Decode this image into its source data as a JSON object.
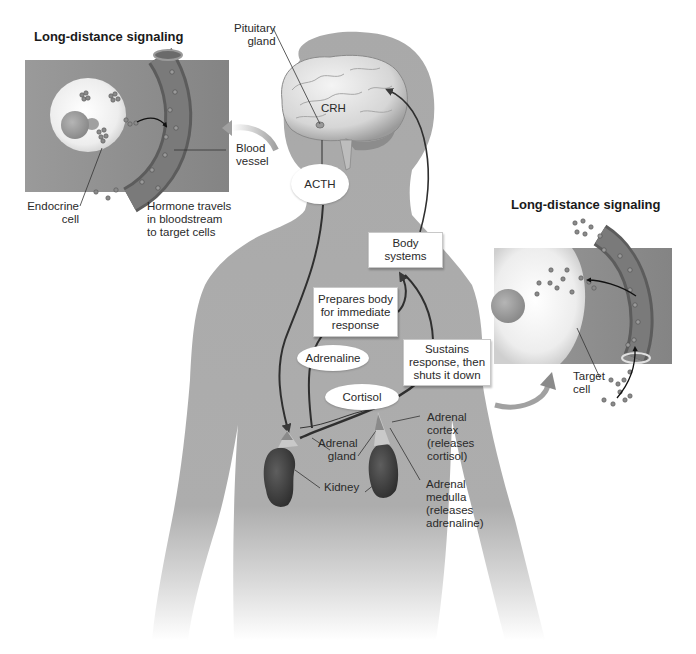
{
  "diagram": {
    "type": "endocrine stress response (HPA axis) illustration",
    "palette": {
      "body": "#a9a9a9",
      "panel_bg": "#8f8f8f",
      "cell": "#f2f2f2",
      "vessel": "#6d6d6d",
      "arrow": "#3a3a3a",
      "box_bg": "#ffffff"
    }
  },
  "panels": {
    "left": {
      "title": "Long-distance signaling",
      "labels": {
        "endocrine_cell": [
          "Endocrine",
          "cell"
        ],
        "hormone_travels": [
          "Hormone travels",
          "in bloodstream",
          "to target cells"
        ],
        "blood_vessel": [
          "Blood",
          "vessel"
        ]
      }
    },
    "right": {
      "title": "Long-distance signaling",
      "labels": {
        "target_cell": [
          "Target",
          "cell"
        ]
      }
    }
  },
  "brain": {
    "pituitary_label": [
      "Pituitary",
      "gland"
    ],
    "crh_label": "CRH"
  },
  "hormones": {
    "acth": "ACTH",
    "adrenaline": "Adrenaline",
    "cortisol": "Cortisol"
  },
  "boxes": {
    "body_systems": [
      "Body",
      "systems"
    ],
    "prepares": [
      "Prepares body",
      "for immediate",
      "response"
    ],
    "sustains": [
      "Sustains",
      "response, then",
      "shuts it down"
    ]
  },
  "organs": {
    "adrenal_gland": [
      "Adrenal",
      "gland"
    ],
    "kidney": "Kidney",
    "adrenal_cortex": [
      "Adrenal",
      "cortex",
      "(releases",
      "cortisol)"
    ],
    "adrenal_medulla": [
      "Adrenal",
      "medulla",
      "(releases",
      "adrenaline)"
    ]
  }
}
